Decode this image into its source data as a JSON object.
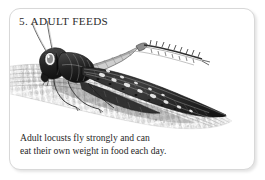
{
  "card": {
    "title": "5. ADULT FEEDS",
    "caption_lines": [
      "Adult locusts fly strongly and can",
      "eat their own weight in food each day."
    ],
    "caption_full": "Adult locusts fly strongly and can eat their own weight in food each day.",
    "border_color": "#d8d8d8",
    "background_color": "#ffffff",
    "text_color": "#272727",
    "title_color": "#2b2b2b"
  },
  "illustration": {
    "subject": "adult locust on maize cob",
    "style": "pen-and-ink stipple engraving",
    "ink_color": "#1c1c1c",
    "mid_tone": "#6e6e6e",
    "light_tone": "#b9b9b9",
    "elements": [
      {
        "name": "locust-body",
        "label": "adult locust"
      },
      {
        "name": "locust-wing",
        "label": "spotted forewing"
      },
      {
        "name": "locust-hind-leg",
        "label": "spined hind leg"
      },
      {
        "name": "locust-antenna",
        "label": "antenna"
      },
      {
        "name": "locust-head",
        "label": "head and compound eye"
      },
      {
        "name": "maize-cob",
        "label": "corn cob with kernels"
      }
    ]
  }
}
